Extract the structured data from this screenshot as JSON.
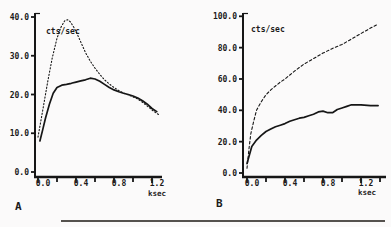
{
  "figure": {
    "description_visible_text_only": "two-panel line figure",
    "panel_letters": [
      "A",
      "B"
    ]
  },
  "chart_data": [
    {
      "type": "line",
      "panel_label": "A",
      "title": "",
      "ylabel": "cts/sec",
      "xlabel": "ksec",
      "xlim": [
        0,
        1.3
      ],
      "ylim": [
        0,
        40
      ],
      "grid": false,
      "legend_position": "none",
      "x_tick_values": [
        0,
        0.2,
        0.4,
        0.6,
        0.8,
        1.0,
        1.2
      ],
      "x_tick_labels": [
        "0.0",
        "",
        "0.4",
        "",
        "0.8",
        "",
        "1.2"
      ],
      "y_tick_values": [
        0,
        10,
        20,
        30,
        40
      ],
      "y_tick_labels": [
        "0.0",
        "10.0",
        "20.0",
        "30.0",
        "40.0"
      ],
      "series": [
        {
          "name": "dotted-curve",
          "style": "dotted",
          "points": [
            [
              0,
              9
            ],
            [
              0.05,
              16
            ],
            [
              0.1,
              23
            ],
            [
              0.15,
              29.5
            ],
            [
              0.2,
              34.5
            ],
            [
              0.24,
              37.3
            ],
            [
              0.28,
              39
            ],
            [
              0.31,
              39.3
            ],
            [
              0.34,
              38.8
            ],
            [
              0.38,
              37.2
            ],
            [
              0.42,
              35.2
            ],
            [
              0.46,
              33
            ],
            [
              0.5,
              30.8
            ],
            [
              0.55,
              28.6
            ],
            [
              0.6,
              26.8
            ],
            [
              0.65,
              25.2
            ],
            [
              0.7,
              23.8
            ],
            [
              0.75,
              22.7
            ],
            [
              0.8,
              21.8
            ],
            [
              0.85,
              21
            ],
            [
              0.9,
              20.4
            ],
            [
              0.95,
              19.9
            ],
            [
              1.0,
              19.4
            ],
            [
              1.05,
              18.8
            ],
            [
              1.1,
              18
            ],
            [
              1.15,
              17
            ],
            [
              1.2,
              16
            ],
            [
              1.27,
              14.8
            ]
          ]
        },
        {
          "name": "solid-curve",
          "style": "solid",
          "points": [
            [
              0.02,
              8
            ],
            [
              0.05,
              11
            ],
            [
              0.08,
              14
            ],
            [
              0.12,
              17.5
            ],
            [
              0.16,
              20.3
            ],
            [
              0.2,
              21.8
            ],
            [
              0.25,
              22.4
            ],
            [
              0.3,
              22.6
            ],
            [
              0.35,
              22.9
            ],
            [
              0.4,
              23.2
            ],
            [
              0.45,
              23.5
            ],
            [
              0.5,
              23.8
            ],
            [
              0.55,
              24.2
            ],
            [
              0.6,
              24
            ],
            [
              0.65,
              23.4
            ],
            [
              0.7,
              22.6
            ],
            [
              0.75,
              21.8
            ],
            [
              0.8,
              21.2
            ],
            [
              0.85,
              20.7
            ],
            [
              0.9,
              20.3
            ],
            [
              0.95,
              20
            ],
            [
              1.0,
              19.6
            ],
            [
              1.05,
              19.1
            ],
            [
              1.1,
              18.4
            ],
            [
              1.15,
              17.5
            ],
            [
              1.2,
              16.4
            ],
            [
              1.25,
              15.6
            ]
          ]
        }
      ]
    },
    {
      "type": "line",
      "panel_label": "B",
      "title": "",
      "ylabel": "cts/sec",
      "xlabel": "ksec",
      "xlim": [
        0,
        1.4
      ],
      "ylim": [
        0,
        100
      ],
      "grid": false,
      "legend_position": "none",
      "x_tick_values": [
        0,
        0.2,
        0.4,
        0.6,
        0.8,
        1.0,
        1.2,
        1.4
      ],
      "x_tick_labels": [
        "0.0",
        "",
        "0.4",
        "",
        "0.8",
        "",
        "1.2",
        ""
      ],
      "y_tick_values": [
        0,
        20,
        40,
        60,
        80,
        100
      ],
      "y_tick_labels": [
        "0.0",
        "20.0",
        "40.0",
        "60.0",
        "80.0",
        "100.0"
      ],
      "series": [
        {
          "name": "dashed-curve",
          "style": "dashed",
          "points": [
            [
              0,
              3
            ],
            [
              0.02,
              15
            ],
            [
              0.04,
              25
            ],
            [
              0.07,
              33
            ],
            [
              0.1,
              40
            ],
            [
              0.15,
              45.5
            ],
            [
              0.2,
              50
            ],
            [
              0.25,
              53
            ],
            [
              0.3,
              55.5
            ],
            [
              0.35,
              58
            ],
            [
              0.4,
              60
            ],
            [
              0.5,
              65
            ],
            [
              0.6,
              69.5
            ],
            [
              0.7,
              73
            ],
            [
              0.8,
              76.5
            ],
            [
              0.9,
              79.5
            ],
            [
              1.0,
              82
            ],
            [
              1.1,
              85.5
            ],
            [
              1.2,
              89
            ],
            [
              1.3,
              92.5
            ],
            [
              1.38,
              95
            ]
          ]
        },
        {
          "name": "solid-curve",
          "style": "solid",
          "points": [
            [
              0,
              6
            ],
            [
              0.05,
              17
            ],
            [
              0.1,
              21
            ],
            [
              0.15,
              24
            ],
            [
              0.2,
              26.5
            ],
            [
              0.25,
              28
            ],
            [
              0.3,
              29.5
            ],
            [
              0.35,
              30.5
            ],
            [
              0.4,
              31.5
            ],
            [
              0.45,
              33
            ],
            [
              0.5,
              34
            ],
            [
              0.55,
              35
            ],
            [
              0.6,
              35.5
            ],
            [
              0.65,
              36.5
            ],
            [
              0.7,
              37.5
            ],
            [
              0.75,
              39
            ],
            [
              0.8,
              39.5
            ],
            [
              0.85,
              38.5
            ],
            [
              0.9,
              38.5
            ],
            [
              0.95,
              40.5
            ],
            [
              1.0,
              41.5
            ],
            [
              1.05,
              42.5
            ],
            [
              1.1,
              43.5
            ],
            [
              1.2,
              43.5
            ],
            [
              1.3,
              43
            ],
            [
              1.38,
              43
            ]
          ]
        }
      ]
    }
  ]
}
